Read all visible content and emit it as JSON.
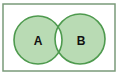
{
  "diagram": {
    "type": "venn",
    "universe": {
      "x": 3,
      "y": 4,
      "width": 112,
      "height": 67,
      "stroke": "#7a9a7a"
    },
    "sets": [
      {
        "label": "A",
        "cx": 38,
        "cy": 40,
        "r": 24
      },
      {
        "label": "B",
        "cx": 80,
        "cy": 39,
        "r": 25
      }
    ],
    "shaded_region": "A XOR B (symmetric difference)",
    "fill_color": "#b9dbb4",
    "stroke_color": "#4e9a4e",
    "intersection_fill": "#ffffff"
  }
}
